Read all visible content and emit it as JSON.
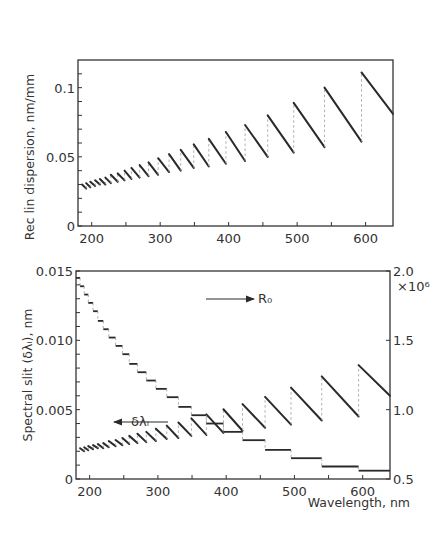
{
  "figure": {
    "width": 434,
    "height": 535,
    "ink_color": "#2a2a2a",
    "dash_color": "#9a9a9a"
  },
  "chart_data": [
    {
      "id": "upper",
      "type": "line",
      "title": "",
      "xlabel": "",
      "ylabel": "Rec lin dispersion, nm/mm",
      "xlim": [
        180,
        640
      ],
      "ylim": [
        0,
        0.12
      ],
      "x_ticks": [
        200,
        250,
        300,
        350,
        400,
        450,
        500,
        550,
        600
      ],
      "x_tick_labels": [
        {
          "value": 200,
          "label": "200"
        },
        {
          "value": 300,
          "label": "300"
        },
        {
          "value": 400,
          "label": "400"
        },
        {
          "value": 500,
          "label": "500"
        },
        {
          "value": 600,
          "label": "600"
        }
      ],
      "y_ticks": [
        0,
        0.01,
        0.02,
        0.03,
        0.04,
        0.05,
        0.06,
        0.07,
        0.08,
        0.09,
        0.1,
        0.11
      ],
      "y_tick_labels": [
        {
          "value": 0,
          "label": "0"
        },
        {
          "value": 0.05,
          "label": "0.05"
        },
        {
          "value": 0.1,
          "label": "0.1"
        }
      ],
      "grid": false,
      "legend": null,
      "plot_box": {
        "left": 78,
        "top": 60,
        "right": 393,
        "bottom": 226
      },
      "series": [
        {
          "name": "Reciprocal linear dispersion (sawtooth per order)",
          "style": "sawtooth",
          "segments": [
            {
              "x0": 186,
              "x1": 192,
              "y0": 0.03,
              "y1": 0.027
            },
            {
              "x0": 192,
              "x1": 198,
              "y0": 0.031,
              "y1": 0.028
            },
            {
              "x0": 198,
              "x1": 205,
              "y0": 0.032,
              "y1": 0.029
            },
            {
              "x0": 205,
              "x1": 212,
              "y0": 0.033,
              "y1": 0.03
            },
            {
              "x0": 212,
              "x1": 220,
              "y0": 0.034,
              "y1": 0.03
            },
            {
              "x0": 220,
              "x1": 228,
              "y0": 0.035,
              "y1": 0.031
            },
            {
              "x0": 228,
              "x1": 238,
              "y0": 0.037,
              "y1": 0.032
            },
            {
              "x0": 238,
              "x1": 248,
              "y0": 0.038,
              "y1": 0.033
            },
            {
              "x0": 248,
              "x1": 258,
              "y0": 0.04,
              "y1": 0.034
            },
            {
              "x0": 258,
              "x1": 270,
              "y0": 0.042,
              "y1": 0.035
            },
            {
              "x0": 270,
              "x1": 283,
              "y0": 0.044,
              "y1": 0.036
            },
            {
              "x0": 283,
              "x1": 297,
              "y0": 0.046,
              "y1": 0.037
            },
            {
              "x0": 297,
              "x1": 313,
              "y0": 0.049,
              "y1": 0.039
            },
            {
              "x0": 313,
              "x1": 330,
              "y0": 0.052,
              "y1": 0.04
            },
            {
              "x0": 330,
              "x1": 349,
              "y0": 0.055,
              "y1": 0.042
            },
            {
              "x0": 349,
              "x1": 371,
              "y0": 0.059,
              "y1": 0.043
            },
            {
              "x0": 371,
              "x1": 396,
              "y0": 0.063,
              "y1": 0.045
            },
            {
              "x0": 396,
              "x1": 424,
              "y0": 0.068,
              "y1": 0.047
            },
            {
              "x0": 424,
              "x1": 457,
              "y0": 0.073,
              "y1": 0.05
            },
            {
              "x0": 457,
              "x1": 495,
              "y0": 0.08,
              "y1": 0.053
            },
            {
              "x0": 495,
              "x1": 540,
              "y0": 0.089,
              "y1": 0.057
            },
            {
              "x0": 540,
              "x1": 594,
              "y0": 0.1,
              "y1": 0.061
            },
            {
              "x0": 594,
              "x1": 640,
              "y0": 0.111,
              "y1": 0.081
            }
          ]
        }
      ]
    },
    {
      "id": "lower",
      "type": "line",
      "title": "",
      "xlabel": "Wavelength, nm",
      "ylabel": "Spectral slit (δλᵢ), nm",
      "y2label": "×10⁶",
      "xlim": [
        180,
        640
      ],
      "ylim": [
        0,
        0.015
      ],
      "y2lim": [
        0.5,
        2.0
      ],
      "x_ticks": [
        200,
        250,
        300,
        350,
        400,
        450,
        500,
        550,
        600
      ],
      "x_tick_labels": [
        {
          "value": 200,
          "label": "200"
        },
        {
          "value": 300,
          "label": "300"
        },
        {
          "value": 400,
          "label": "400"
        },
        {
          "value": 500,
          "label": "500"
        },
        {
          "value": 600,
          "label": "600"
        }
      ],
      "y_ticks": [
        0,
        0.001,
        0.002,
        0.003,
        0.004,
        0.005,
        0.006,
        0.007,
        0.008,
        0.009,
        0.01,
        0.011,
        0.012,
        0.013,
        0.014,
        0.015
      ],
      "y_tick_labels": [
        {
          "value": 0,
          "label": "0"
        },
        {
          "value": 0.005,
          "label": "0.005"
        },
        {
          "value": 0.01,
          "label": "0.010"
        },
        {
          "value": 0.015,
          "label": "0.015"
        }
      ],
      "y2_ticks": [
        0.5,
        1.0,
        1.5,
        2.0
      ],
      "y2_tick_labels": [
        {
          "value": 0.5,
          "label": "0.5"
        },
        {
          "value": 1.0,
          "label": "1.0"
        },
        {
          "value": 1.5,
          "label": "1.5"
        },
        {
          "value": 2.0,
          "label": "2.0"
        }
      ],
      "grid": false,
      "plot_box": {
        "left": 76,
        "top": 271,
        "right": 390,
        "bottom": 479
      },
      "annotations": [
        {
          "text": "R₀",
          "x": 258,
          "y": 303,
          "arrow": {
            "x1": 206,
            "y1": 299,
            "x2": 254,
            "y2": 299
          }
        },
        {
          "text": "δλᵢ",
          "x": 131,
          "y": 426,
          "arrow": {
            "x1": 168,
            "y1": 422,
            "x2": 114,
            "y2": 422
          }
        }
      ],
      "series": [
        {
          "name": "δλᵢ",
          "axis": "left",
          "style": "sawtooth",
          "segments": [
            {
              "x0": 186,
              "x1": 192,
              "y0": 0.00222,
              "y1": 0.002
            },
            {
              "x0": 192,
              "x1": 198,
              "y0": 0.00229,
              "y1": 0.00207
            },
            {
              "x0": 198,
              "x1": 205,
              "y0": 0.00237,
              "y1": 0.00215
            },
            {
              "x0": 205,
              "x1": 212,
              "y0": 0.00244,
              "y1": 0.00222
            },
            {
              "x0": 212,
              "x1": 220,
              "y0": 0.00252,
              "y1": 0.00222
            },
            {
              "x0": 220,
              "x1": 228,
              "y0": 0.00259,
              "y1": 0.00229
            },
            {
              "x0": 228,
              "x1": 238,
              "y0": 0.00274,
              "y1": 0.00237
            },
            {
              "x0": 238,
              "x1": 248,
              "y0": 0.00281,
              "y1": 0.00244
            },
            {
              "x0": 248,
              "x1": 258,
              "y0": 0.00296,
              "y1": 0.00252
            },
            {
              "x0": 258,
              "x1": 270,
              "y0": 0.00311,
              "y1": 0.00259
            },
            {
              "x0": 270,
              "x1": 283,
              "y0": 0.00326,
              "y1": 0.00266
            },
            {
              "x0": 283,
              "x1": 297,
              "y0": 0.0034,
              "y1": 0.00274
            },
            {
              "x0": 297,
              "x1": 313,
              "y0": 0.00363,
              "y1": 0.00289
            },
            {
              "x0": 313,
              "x1": 330,
              "y0": 0.00385,
              "y1": 0.00296
            },
            {
              "x0": 330,
              "x1": 349,
              "y0": 0.00407,
              "y1": 0.00311
            },
            {
              "x0": 349,
              "x1": 371,
              "y0": 0.00437,
              "y1": 0.00318
            },
            {
              "x0": 371,
              "x1": 396,
              "y0": 0.00466,
              "y1": 0.00333
            },
            {
              "x0": 396,
              "x1": 424,
              "y0": 0.00503,
              "y1": 0.00348
            },
            {
              "x0": 424,
              "x1": 457,
              "y0": 0.0054,
              "y1": 0.0037
            },
            {
              "x0": 457,
              "x1": 495,
              "y0": 0.00592,
              "y1": 0.00392
            },
            {
              "x0": 495,
              "x1": 540,
              "y0": 0.00659,
              "y1": 0.00422
            },
            {
              "x0": 540,
              "x1": 594,
              "y0": 0.0074,
              "y1": 0.00451
            },
            {
              "x0": 594,
              "x1": 640,
              "y0": 0.00821,
              "y1": 0.006
            }
          ]
        },
        {
          "name": "R₀",
          "axis": "right",
          "unit": "×10⁶",
          "style": "staircase",
          "steps": [
            {
              "x0": 180,
              "x1": 186,
              "y": 1.95
            },
            {
              "x0": 186,
              "x1": 192,
              "y": 1.89
            },
            {
              "x0": 192,
              "x1": 198,
              "y": 1.83
            },
            {
              "x0": 198,
              "x1": 205,
              "y": 1.77
            },
            {
              "x0": 205,
              "x1": 212,
              "y": 1.71
            },
            {
              "x0": 212,
              "x1": 220,
              "y": 1.64
            },
            {
              "x0": 220,
              "x1": 228,
              "y": 1.58
            },
            {
              "x0": 228,
              "x1": 238,
              "y": 1.52
            },
            {
              "x0": 238,
              "x1": 248,
              "y": 1.46
            },
            {
              "x0": 248,
              "x1": 258,
              "y": 1.4
            },
            {
              "x0": 258,
              "x1": 270,
              "y": 1.33
            },
            {
              "x0": 270,
              "x1": 283,
              "y": 1.27
            },
            {
              "x0": 283,
              "x1": 297,
              "y": 1.21
            },
            {
              "x0": 297,
              "x1": 313,
              "y": 1.15
            },
            {
              "x0": 313,
              "x1": 330,
              "y": 1.09
            },
            {
              "x0": 330,
              "x1": 349,
              "y": 1.02
            },
            {
              "x0": 349,
              "x1": 371,
              "y": 0.96
            },
            {
              "x0": 371,
              "x1": 396,
              "y": 0.9
            },
            {
              "x0": 396,
              "x1": 424,
              "y": 0.84
            },
            {
              "x0": 424,
              "x1": 457,
              "y": 0.78
            },
            {
              "x0": 457,
              "x1": 495,
              "y": 0.71
            },
            {
              "x0": 495,
              "x1": 540,
              "y": 0.65
            },
            {
              "x0": 540,
              "x1": 594,
              "y": 0.59
            },
            {
              "x0": 594,
              "x1": 640,
              "y": 0.56
            }
          ]
        }
      ]
    }
  ]
}
